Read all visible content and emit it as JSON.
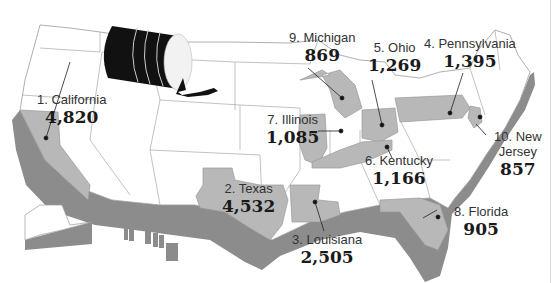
{
  "map": {
    "subject": "United States map with ranked states",
    "colors": {
      "background": "#ffffff",
      "state_default": "#ffffff",
      "state_border": "#9a9a9a",
      "state_highlight": "#b8b8b8",
      "extrusion": "#8c8c8c",
      "text": "#222222",
      "barrel": "#111111"
    },
    "icon": "oil-barrel-spill-icon",
    "states": [
      {
        "rank": "1.",
        "name": "California",
        "label": "1. California",
        "value": "4,820"
      },
      {
        "rank": "2.",
        "name": "Texas",
        "label": "2. Texas",
        "value": "4,532"
      },
      {
        "rank": "3.",
        "name": "Louisiana",
        "label": "3. Louisiana",
        "value": "2,505"
      },
      {
        "rank": "4.",
        "name": "Pennsylvania",
        "label": "4. Pennsylvania",
        "value": "1,395"
      },
      {
        "rank": "5.",
        "name": "Ohio",
        "label": "5. Ohio",
        "value": "1,269"
      },
      {
        "rank": "6.",
        "name": "Kentucky",
        "label": "6. Kentucky",
        "value": "1,166"
      },
      {
        "rank": "7.",
        "name": "Illinois",
        "label": "7. Illinois",
        "value": "1,085"
      },
      {
        "rank": "8.",
        "name": "Florida",
        "label": "8. Florida",
        "value": "905"
      },
      {
        "rank": "9.",
        "name": "Michigan",
        "label": "9. Michigan",
        "value": "869"
      },
      {
        "rank": "10.",
        "name": "New Jersey",
        "label_line1": "10. New",
        "label_line2": "Jersey",
        "value": "857"
      }
    ]
  }
}
